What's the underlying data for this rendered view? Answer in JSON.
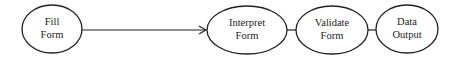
{
  "diagram": {
    "nodes": [
      {
        "id": "fill-form",
        "lines": [
          "Fill",
          "Form"
        ],
        "cx": 52,
        "cy": 29,
        "rx": 30,
        "ry": 24
      },
      {
        "id": "interpret-form",
        "lines": [
          "Interpret",
          "Form"
        ],
        "cx": 247,
        "cy": 30,
        "rx": 40,
        "ry": 24
      },
      {
        "id": "validate-form",
        "lines": [
          "Validate",
          "Form"
        ],
        "cx": 332,
        "cy": 30,
        "rx": 36,
        "ry": 24
      },
      {
        "id": "data-output",
        "lines": [
          "Data",
          "Output"
        ],
        "cx": 407,
        "cy": 29,
        "rx": 31,
        "ry": 24
      }
    ],
    "edges": [
      {
        "from": "fill-form",
        "to": "interpret-form",
        "type": "arrow"
      },
      {
        "from": "interpret-form",
        "to": "validate-form",
        "type": "line"
      },
      {
        "from": "validate-form",
        "to": "data-output",
        "type": "line"
      }
    ],
    "colors": {
      "stroke": "#222222",
      "background": "#ffffff"
    }
  }
}
